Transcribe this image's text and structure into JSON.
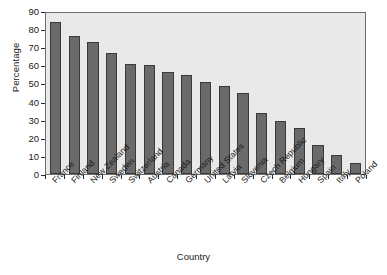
{
  "chart_data": {
    "type": "bar",
    "title": "",
    "xlabel": "Country",
    "ylabel": "Percentage",
    "categories": [
      "France",
      "Finland",
      "New Zealand",
      "Sweden",
      "Switzerland",
      "Austria",
      "Canada",
      "Germany",
      "United States",
      "Latvia",
      "Slovenia",
      "Czech Republic",
      "Belgium",
      "Hungary",
      "Spain",
      "Italy",
      "Poland"
    ],
    "values": [
      84,
      76,
      73,
      67,
      60.5,
      60,
      56.5,
      54.5,
      51,
      48.5,
      45,
      33.5,
      29.5,
      25.5,
      16,
      10.5,
      6
    ],
    "ylim": [
      0,
      90
    ],
    "ytick_values": [
      0,
      10,
      20,
      30,
      40,
      50,
      60,
      70,
      80,
      90
    ],
    "ytick_labels": [
      "0",
      "10",
      "20",
      "30",
      "40",
      "50",
      "60",
      "70",
      "80",
      "90"
    ],
    "grid": false,
    "legend": null,
    "bar_color": "#6a6a6a",
    "bar_edge_color": "#3a3a3a",
    "plot_background": "#e9e9e9",
    "axis_color": "#6e6e6e",
    "text_color": "#1b1b1b"
  }
}
